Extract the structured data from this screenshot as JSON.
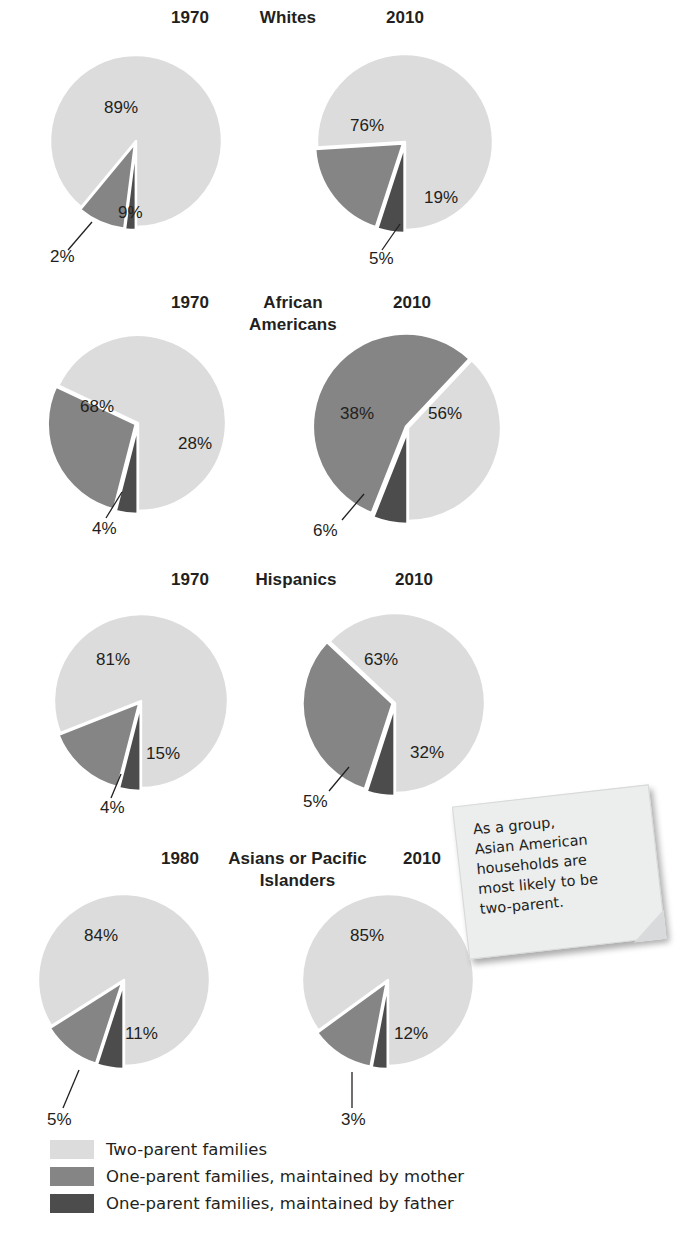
{
  "colors": {
    "two_parent": "#dcdcdc",
    "mother": "#858585",
    "father": "#4c4c4c",
    "text": "#231f20",
    "note_bg": "#eceded",
    "background": "#ffffff"
  },
  "legend": {
    "items": [
      {
        "label": "Two-parent families",
        "color_key": "two_parent"
      },
      {
        "label": "One-parent families, maintained by mother",
        "color_key": "mother"
      },
      {
        "label": "One-parent families, maintained by father",
        "color_key": "father"
      }
    ]
  },
  "callout": {
    "text": "As a group, Asian American households are most likely to be two-parent.",
    "lines": [
      "As a group,",
      "Asian American",
      "households are",
      "most likely to be",
      "two-parent."
    ]
  },
  "rows": [
    {
      "group": "Whites",
      "group_lines": [
        "Whites"
      ],
      "left_year": "1970",
      "right_year": "2010",
      "left": {
        "two_parent": "89%",
        "mother": "9%",
        "father": "2%"
      },
      "right": {
        "two_parent": "76%",
        "mother": "19%",
        "father": "5%"
      }
    },
    {
      "group": "African Americans",
      "group_lines": [
        "African",
        "Americans"
      ],
      "left_year": "1970",
      "right_year": "2010",
      "left": {
        "two_parent": "68%",
        "mother": "28%",
        "father": "4%"
      },
      "right": {
        "two_parent": "38%",
        "mother": "56%",
        "father": "6%"
      }
    },
    {
      "group": "Hispanics",
      "group_lines": [
        "Hispanics"
      ],
      "left_year": "1970",
      "right_year": "2010",
      "left": {
        "two_parent": "81%",
        "mother": "15%",
        "father": "4%"
      },
      "right": {
        "two_parent": "63%",
        "mother": "32%",
        "father": "5%"
      }
    },
    {
      "group": "Asians or Pacific Islanders",
      "group_lines": [
        "Asians or Pacific",
        "Islanders"
      ],
      "left_year": "1980",
      "right_year": "2010",
      "left": {
        "two_parent": "84%",
        "mother": "11%",
        "father": "5%"
      },
      "right": {
        "two_parent": "85%",
        "mother": "12%",
        "father": "3%"
      }
    }
  ],
  "chart_data": {
    "type": "pie",
    "categories": [
      "Two-parent families",
      "One-parent families, maintained by mother",
      "One-parent families, maintained by father"
    ],
    "units": "percent of families",
    "legend_position": "bottom-left",
    "panels": [
      {
        "group": "Whites",
        "year": "1970",
        "values": [
          89,
          9,
          2
        ],
        "labels": [
          "89%",
          "9%",
          "2%"
        ]
      },
      {
        "group": "Whites",
        "year": "2010",
        "values": [
          76,
          19,
          5
        ],
        "labels": [
          "76%",
          "19%",
          "5%"
        ]
      },
      {
        "group": "African Americans",
        "year": "1970",
        "values": [
          68,
          28,
          4
        ],
        "labels": [
          "68%",
          "28%",
          "4%"
        ]
      },
      {
        "group": "African Americans",
        "year": "2010",
        "values": [
          38,
          56,
          6
        ],
        "labels": [
          "38%",
          "56%",
          "6%"
        ]
      },
      {
        "group": "Hispanics",
        "year": "1970",
        "values": [
          81,
          15,
          4
        ],
        "labels": [
          "81%",
          "15%",
          "4%"
        ]
      },
      {
        "group": "Hispanics",
        "year": "2010",
        "values": [
          63,
          32,
          5
        ],
        "labels": [
          "63%",
          "32%",
          "5%"
        ]
      },
      {
        "group": "Asians or Pacific Islanders",
        "year": "1980",
        "values": [
          84,
          11,
          5
        ],
        "labels": [
          "84%",
          "11%",
          "5%"
        ]
      },
      {
        "group": "Asians or Pacific Islanders",
        "year": "2010",
        "values": [
          85,
          12,
          3
        ],
        "labels": [
          "85%",
          "12%",
          "3%"
        ]
      }
    ],
    "annotation": "As a group, Asian American households are most likely to be two-parent."
  }
}
